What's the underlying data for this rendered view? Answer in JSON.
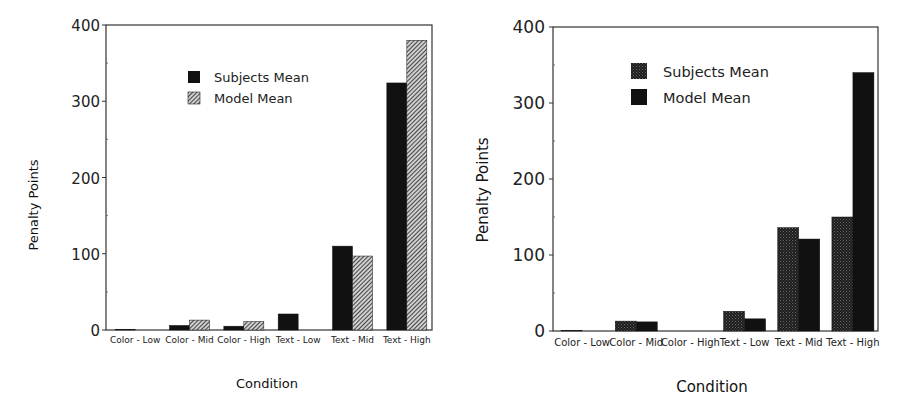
{
  "chart_data": [
    {
      "type": "bar",
      "title": "",
      "xlabel": "Condition",
      "ylabel": "Penalty Points",
      "ylim": [
        0,
        400
      ],
      "yticks": [
        0,
        100,
        200,
        300,
        400
      ],
      "grid": false,
      "legend_position": "upper-center",
      "categories": [
        "Color - Low",
        "Color - Mid",
        "Color - High",
        "Text - Low",
        "Text - Mid",
        "Text - High"
      ],
      "series": [
        {
          "name": "Subjects Mean",
          "fill": "solid-black",
          "values": [
            1,
            6,
            5,
            21,
            110,
            324
          ]
        },
        {
          "name": "Model Mean",
          "fill": "diagonal-hatch",
          "values": [
            0,
            13,
            11,
            0,
            97,
            380
          ]
        }
      ]
    },
    {
      "type": "bar",
      "title": "",
      "xlabel": "Condition",
      "ylabel": "Penalty Points",
      "ylim": [
        0,
        400
      ],
      "yticks": [
        0,
        100,
        200,
        300,
        400
      ],
      "grid": false,
      "legend_position": "upper-center",
      "categories": [
        "Color - Low",
        "Color - Mid",
        "Color - High",
        "Text - Low",
        "Text - Mid",
        "Text - High"
      ],
      "series": [
        {
          "name": "Subjects Mean",
          "fill": "dark-stipple",
          "values": [
            1,
            13,
            0,
            26,
            136,
            150
          ]
        },
        {
          "name": "Model Mean",
          "fill": "solid-black",
          "values": [
            0,
            12,
            0,
            16,
            121,
            340
          ]
        }
      ]
    }
  ],
  "colors": {
    "bar_dark": "#111111",
    "stipple": "#2a2a2a",
    "axis": "#333333"
  }
}
